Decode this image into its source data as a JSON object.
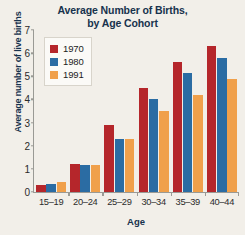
{
  "chart_data": {
    "type": "bar",
    "title": "Average Number of Births, by Age Cohort",
    "title_line1": "Average Number of Births,",
    "title_line2": "by Age Cohort",
    "xlabel": "Age",
    "ylabel": "Average number of live births",
    "categories": [
      "15–19",
      "20–24",
      "25–29",
      "30–34",
      "35–39",
      "40–44"
    ],
    "ylim": [
      0,
      7
    ],
    "yticks": [
      0,
      1,
      2,
      3,
      4,
      5,
      6,
      7
    ],
    "grid": false,
    "legend_position": "upper left",
    "series": [
      {
        "name": "1970",
        "color": "#b5262b",
        "values": [
          0.3,
          1.2,
          2.9,
          4.5,
          5.6,
          6.3
        ]
      },
      {
        "name": "1980",
        "color": "#2b6ca3",
        "values": [
          0.35,
          1.15,
          2.3,
          4.0,
          5.15,
          5.8
        ]
      },
      {
        "name": "1991",
        "color": "#f0a04b",
        "values": [
          0.45,
          1.15,
          2.3,
          3.5,
          4.2,
          4.9
        ]
      }
    ]
  },
  "colors": {
    "background": "#f2efe9",
    "title_text": "#17324d",
    "axis": "#9a9a95",
    "tick_text": "#2b2b2b",
    "legend_background": "#fbfaf7",
    "legend_border": "#d8d4cb"
  }
}
